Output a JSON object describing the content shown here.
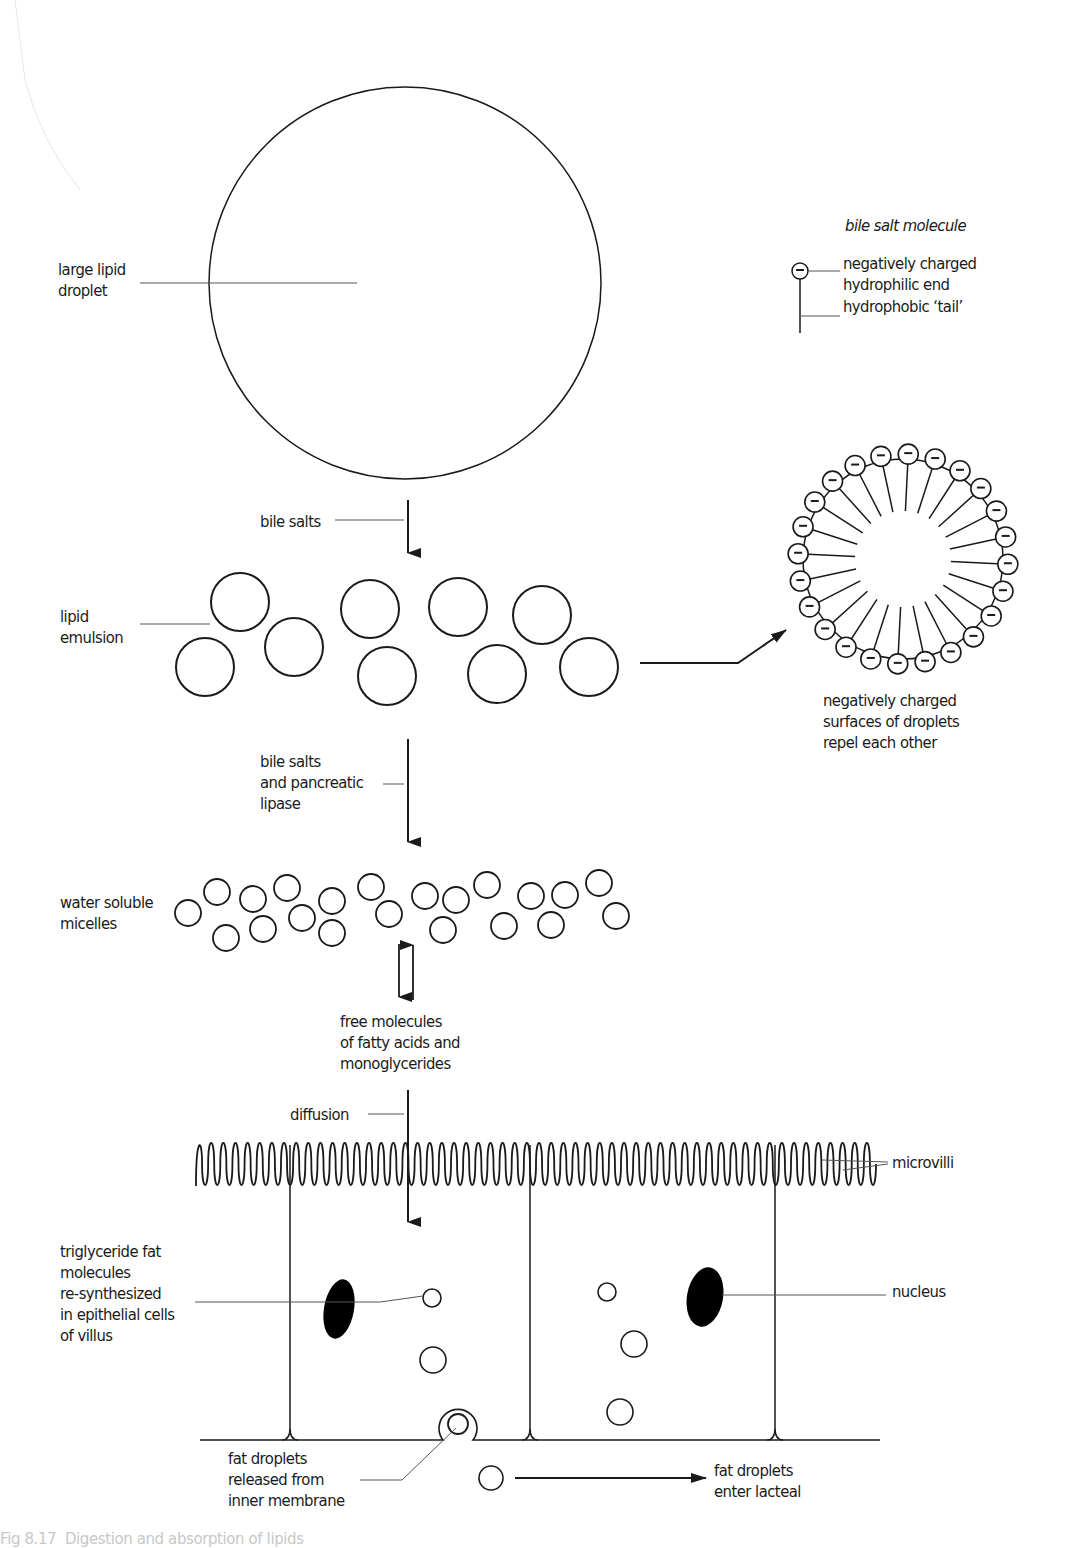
{
  "figure": {
    "colors": {
      "ink": "#1a1a1a",
      "leader": "#555555",
      "background": "#ffffff",
      "nucleus_fill": "#000000"
    },
    "large_droplet": {
      "cx": 405,
      "cy": 283,
      "r": 196
    },
    "labels": {
      "large_lipid_droplet": {
        "text": "large lipid\ndroplet",
        "x": 58,
        "y": 259
      },
      "bile_salt_molecule_title": {
        "text": "bile salt molecule",
        "x": 845,
        "y": 215
      },
      "hydrophilic_end": {
        "text": "negatively charged\nhydrophilic end",
        "x": 843,
        "y": 253
      },
      "hydrophobic_tail": {
        "text": "hydrophobic ‘tail’",
        "x": 843,
        "y": 296
      },
      "bile_salts": {
        "text": "bile salts",
        "x": 260,
        "y": 511
      },
      "lipid_emulsion": {
        "text": "lipid\nemulsion",
        "x": 60,
        "y": 606
      },
      "repel": {
        "text": "negatively charged\nsurfaces of droplets\nrepel each other",
        "x": 823,
        "y": 690
      },
      "bile_salts_lipase": {
        "text": "bile salts\nand pancreatic\nlipase",
        "x": 260,
        "y": 751
      },
      "micelles": {
        "text": "water soluble\nmicelles",
        "x": 60,
        "y": 892
      },
      "free_molecules": {
        "text": "free molecules\nof fatty acids and\nmonoglycerides",
        "x": 340,
        "y": 1011
      },
      "diffusion": {
        "text": "diffusion",
        "x": 290,
        "y": 1104
      },
      "microvilli": {
        "text": "microvilli",
        "x": 892,
        "y": 1152
      },
      "triglyceride": {
        "text": "triglyceride fat\nmolecules\nre-synthesized\nin epithelial cells\nof villus",
        "x": 60,
        "y": 1241
      },
      "nucleus": {
        "text": "nucleus",
        "x": 892,
        "y": 1281
      },
      "fat_released": {
        "text": "fat droplets\nreleased from\ninner membrane",
        "x": 228,
        "y": 1448
      },
      "enter_lacteal": {
        "text": "fat droplets\nenter lacteal",
        "x": 714,
        "y": 1460
      }
    },
    "caption": "Fig 8.17  Digestion and absorption of lipids",
    "emulsion_droplets": [
      {
        "cx": 240,
        "cy": 602,
        "r": 29
      },
      {
        "cx": 205,
        "cy": 667,
        "r": 29
      },
      {
        "cx": 294,
        "cy": 647,
        "r": 29
      },
      {
        "cx": 370,
        "cy": 609,
        "r": 29
      },
      {
        "cx": 387,
        "cy": 676,
        "r": 29
      },
      {
        "cx": 458,
        "cy": 607,
        "r": 29
      },
      {
        "cx": 497,
        "cy": 674,
        "r": 29
      },
      {
        "cx": 542,
        "cy": 615,
        "r": 29
      },
      {
        "cx": 589,
        "cy": 667,
        "r": 29
      }
    ],
    "micelles": [
      {
        "cx": 188,
        "cy": 913
      },
      {
        "cx": 217,
        "cy": 892
      },
      {
        "cx": 226,
        "cy": 938
      },
      {
        "cx": 253,
        "cy": 899
      },
      {
        "cx": 263,
        "cy": 929
      },
      {
        "cx": 287,
        "cy": 888
      },
      {
        "cx": 302,
        "cy": 918
      },
      {
        "cx": 332,
        "cy": 901
      },
      {
        "cx": 332,
        "cy": 933
      },
      {
        "cx": 371,
        "cy": 887
      },
      {
        "cx": 389,
        "cy": 914
      },
      {
        "cx": 425,
        "cy": 896
      },
      {
        "cx": 443,
        "cy": 930
      },
      {
        "cx": 456,
        "cy": 900
      },
      {
        "cx": 487,
        "cy": 885
      },
      {
        "cx": 504,
        "cy": 926
      },
      {
        "cx": 531,
        "cy": 896
      },
      {
        "cx": 551,
        "cy": 925
      },
      {
        "cx": 565,
        "cy": 895
      },
      {
        "cx": 599,
        "cy": 883
      },
      {
        "cx": 616,
        "cy": 916
      }
    ],
    "micelle_r": 13,
    "charged_droplet": {
      "cx": 903,
      "cy": 559,
      "r": 100,
      "head_r": 10,
      "count": 24,
      "inner_r": 48
    },
    "epithelium": {
      "microvilli_y_top": 1140,
      "microvilli_y_bottom": 1188,
      "x_start": 196,
      "x_end": 876,
      "count": 56,
      "cell_walls_x": [
        290,
        530,
        775
      ],
      "basement_y": 1440,
      "basement_x1": 200,
      "basement_x2": 880,
      "nuclei": [
        {
          "cx": 339,
          "cy": 1309,
          "rx": 15,
          "ry": 30
        },
        {
          "cx": 705,
          "cy": 1297,
          "rx": 18,
          "ry": 30
        }
      ],
      "fat_droplets": [
        {
          "cx": 432,
          "cy": 1298,
          "r": 9
        },
        {
          "cx": 433,
          "cy": 1360,
          "r": 13
        },
        {
          "cx": 607,
          "cy": 1292,
          "r": 9
        },
        {
          "cx": 634,
          "cy": 1344,
          "r": 13
        },
        {
          "cx": 620,
          "cy": 1412,
          "r": 13
        }
      ],
      "exocytosis": {
        "cx": 458,
        "cy": 1424,
        "r_in": 10,
        "r_out": 19
      },
      "lacteal_droplet": {
        "cx": 491,
        "cy": 1478,
        "r": 12
      }
    }
  }
}
